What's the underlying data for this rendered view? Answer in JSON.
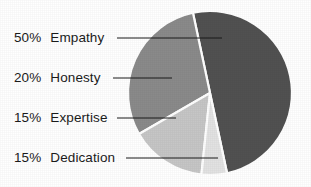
{
  "chart_data": {
    "type": "pie",
    "title": "",
    "subtitle": "",
    "xlabel": "",
    "ylabel": "",
    "legend_position": "left-callout-labels",
    "grid": false,
    "units": "percent",
    "total": 100,
    "categories": [
      "Empathy",
      "Honesty",
      "Expertise",
      "Dedication"
    ],
    "values": [
      50,
      20,
      15,
      15
    ],
    "labels": [
      "50%",
      "20%",
      "15%",
      "15%"
    ],
    "colors": [
      "#515151",
      "#8a8a8a",
      "#c6c6c6",
      "#e2e2e2"
    ],
    "slices": [
      {
        "name": "Empathy",
        "value": 50,
        "percent_label": "50%",
        "color": "#515151",
        "start_angle": -12,
        "end_angle": 168
      },
      {
        "name": "Honesty",
        "value": 20,
        "percent_label": "20%",
        "color": "#8a8a8a",
        "start_angle": 240,
        "end_angle": 348
      },
      {
        "name": "Expertise",
        "value": 15,
        "percent_label": "15%",
        "color": "#c6c6c6",
        "start_angle": 186,
        "end_angle": 240
      },
      {
        "name": "Dedication",
        "value": 15,
        "percent_label": "15%",
        "color": "#e2e2e2",
        "start_angle": 168,
        "end_angle": 186
      }
    ]
  },
  "chart": {
    "background_color": "#ffffff",
    "separator_color": "#ffffff",
    "leader_line_color": "#1b1b1b",
    "text_color": "#1b1b1b",
    "center_x": 210,
    "center_y": 93,
    "radius": 82
  },
  "callouts": [
    {
      "percent": "50%",
      "name": "Empathy",
      "label_y": 38,
      "line_x1": 117,
      "line_x2": 222,
      "line_y": 38
    },
    {
      "percent": "20%",
      "name": "Honesty",
      "label_y": 78,
      "line_x1": 113,
      "line_x2": 172,
      "line_y": 78
    },
    {
      "percent": "15%",
      "name": "Expertise",
      "label_y": 118,
      "line_x1": 117,
      "line_x2": 176,
      "line_y": 118
    },
    {
      "percent": "15%",
      "name": "Dedication",
      "label_y": 158,
      "line_x1": 126,
      "line_x2": 218,
      "line_y": 158
    }
  ]
}
